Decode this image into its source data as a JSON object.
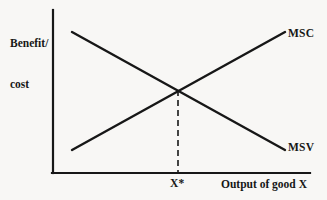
{
  "figure": {
    "background_color": "#f8f7f5",
    "ink_color": "#171717",
    "width": 327,
    "height": 200
  },
  "axes": {
    "y_title_line1": "Benefit/",
    "y_title_line2": "cost",
    "x_title": "Output of good X",
    "origin": {
      "x": 53,
      "y": 173
    },
    "y_axis_top": {
      "x": 53,
      "y": 10
    },
    "x_axis_right": {
      "x": 310,
      "y": 173
    },
    "line_width": 2
  },
  "equilibrium": {
    "tick_label": "X*",
    "x": 178,
    "y": 88,
    "dropline_style": "dashed",
    "dropline_from_y": 90,
    "dropline_to_y": 173
  },
  "chart_data": {
    "type": "line",
    "title": "",
    "xlabel": "Output of good X",
    "ylabel": "Benefit/cost",
    "grid": false,
    "legend_position": "right-inline",
    "axis_ticks": {
      "x": [
        "X*"
      ],
      "y": []
    },
    "xlim": [
      53,
      310
    ],
    "ylim": [
      173,
      10
    ],
    "series": [
      {
        "name": "MSC",
        "label": "MSC",
        "slope": "upward",
        "color": "#171717",
        "points": [
          {
            "x": 72,
            "y": 150
          },
          {
            "x": 285,
            "y": 32
          }
        ],
        "label_position": {
          "x": 288,
          "y": 27
        }
      },
      {
        "name": "MSV",
        "label": "MSV",
        "slope": "downward",
        "color": "#171717",
        "points": [
          {
            "x": 72,
            "y": 32
          },
          {
            "x": 285,
            "y": 150
          }
        ],
        "label_position": {
          "x": 288,
          "y": 141
        }
      }
    ],
    "annotations": [
      {
        "name": "equilibrium-intersection",
        "text": "X*",
        "x": 178,
        "y": 88
      }
    ]
  }
}
